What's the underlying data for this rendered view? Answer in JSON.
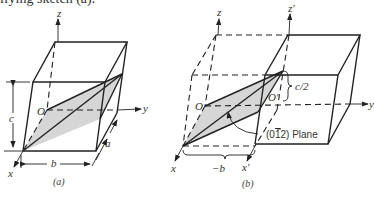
{
  "header_text": "ifying sketch (a).",
  "figure_a": {
    "caption": "(a)",
    "axis_labels": {
      "z": "z",
      "y": "y",
      "x": "x"
    },
    "origin_label": "O",
    "dimension_labels": {
      "c": "c",
      "b": "b",
      "a": "a"
    }
  },
  "figure_b": {
    "caption": "(b)",
    "axis_labels": {
      "z": "z",
      "z_prime": "z'",
      "y": "y",
      "x": "x",
      "x_prime": "x'"
    },
    "origin_label": "O",
    "origin_prime_label": "O'",
    "dimension_labels": {
      "half_c": "c/2",
      "neg_b": "−b"
    },
    "plane_label": "(0̅2) Plane",
    "plane_label_parts": {
      "open": "(0",
      "bar_digit": "1",
      "close": "2) Plane"
    }
  },
  "colors": {
    "line": "#222222",
    "shade": "#d6d6d6",
    "background": "#ffffff"
  }
}
